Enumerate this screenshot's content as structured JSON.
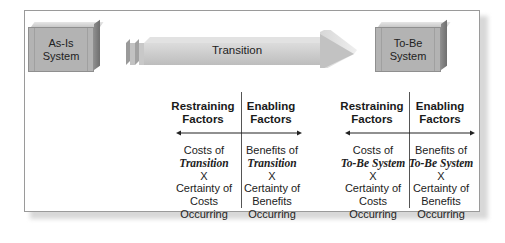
{
  "diagram": {
    "as_is": {
      "line1": "As-Is",
      "line2": "System"
    },
    "to_be": {
      "line1": "To-Be",
      "line2": "System"
    },
    "transition_label": "Transition",
    "sections": [
      {
        "restraining": {
          "title1": "Restraining",
          "title2": "Factors",
          "l1": "Costs of",
          "l2": "Transition",
          "l3": "X",
          "l4": "Certainty of",
          "l5": "Costs",
          "l6": "Occurring"
        },
        "enabling": {
          "title1": "Enabling",
          "title2": "Factors",
          "l1": "Benefits of",
          "l2": "Transition",
          "l3": "X",
          "l4": "Certainty of",
          "l5": "Benefits",
          "l6": "Occurring"
        }
      },
      {
        "restraining": {
          "title1": "Restraining",
          "title2": "Factors",
          "l1": "Costs of",
          "l2": "To-Be System",
          "l3": "X",
          "l4": "Certainty of",
          "l5": "Costs",
          "l6": "Occurring"
        },
        "enabling": {
          "title1": "Enabling",
          "title2": "Factors",
          "l1": "Benefits of",
          "l2": "To-Be System",
          "l3": "X",
          "l4": "Certainty of",
          "l5": "Benefits",
          "l6": "Occurring"
        }
      }
    ],
    "colors": {
      "box_face": "#b3b3b3",
      "arrow_fill": "#c4c4c4",
      "frame_border": "#9a9a9a",
      "text": "#1a1a1a"
    }
  }
}
